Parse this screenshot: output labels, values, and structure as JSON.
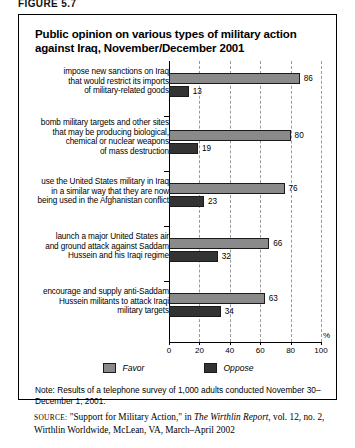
{
  "figure_label": "FIGURE 5.7",
  "title": "Public opinion on various types of military action against Iraq, November/December 2001",
  "note": "Note: Results of a telephone survey of 1,000 adults conducted November 30–December 1, 2001.",
  "source": {
    "label": "SOURCE:",
    "pre": " \"Support for Military Action,\" in ",
    "italic": "The Wirthlin Report",
    "post": ", vol. 12, no. 2, Wirthlin Worldwide, McLean, VA, March–April 2002"
  },
  "legend": [
    {
      "name": "Favor",
      "color": "#8a8a8a"
    },
    {
      "name": "Oppose",
      "color": "#333333"
    }
  ],
  "chart_data": {
    "type": "bar",
    "orientation": "horizontal",
    "title": "Public opinion on various types of military action against Iraq, November/December 2001",
    "xlabel": "%",
    "ylabel": "",
    "xlim": [
      0,
      100
    ],
    "xticks": [
      "0",
      "20",
      "40",
      "60",
      "80",
      "100"
    ],
    "grid": true,
    "legend_position": "bottom",
    "categories": [
      "impose new sanctions on Iraq\nthat would restrict its imports\nof military-related goods",
      "bomb military targets and other sites\nthat may be producing biological,\nchemical or nuclear weapons\nof mass destruction",
      "use the United States military in Iraq\nin a similar way that they are now\nbeing used in the Afghanistan conflict",
      "launch a major United States air\nand ground attack against Saddam\nHussein and his Iraqi regime",
      "encourage and supply anti-Saddam\nHussein militants to attack Iraqi\nmilitary targets"
    ],
    "series": [
      {
        "name": "Favor",
        "color": "#8a8a8a",
        "values": [
          86,
          80,
          76,
          66,
          63
        ]
      },
      {
        "name": "Oppose",
        "color": "#333333",
        "values": [
          13,
          19,
          23,
          32,
          34
        ]
      }
    ]
  }
}
